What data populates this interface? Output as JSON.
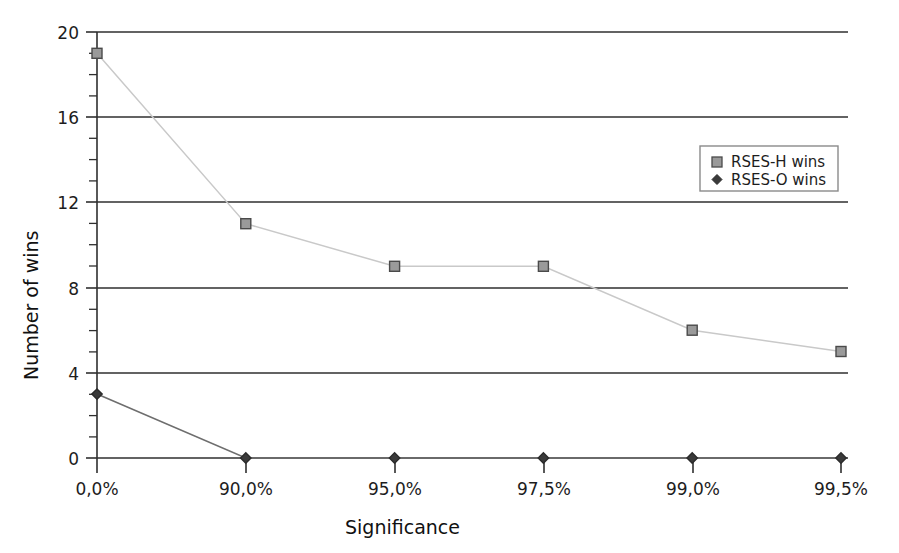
{
  "chart_data": {
    "type": "line",
    "title": "",
    "xlabel": "Significance",
    "ylabel": "Number of wins",
    "categories": [
      "0,0%",
      "90,0%",
      "95,0%",
      "97,5%",
      "99,0%",
      "99,5%"
    ],
    "series": [
      {
        "name": "RSES-H wins",
        "marker": "square",
        "color": "#c9c9c9",
        "marker_fill": "#9a9a9a",
        "marker_stroke": "#4a4a4a",
        "values": [
          19,
          11,
          9,
          9,
          6,
          5
        ]
      },
      {
        "name": "RSES-O wins",
        "marker": "diamond",
        "color": "#6e6e6e",
        "marker_fill": "#3a3a3a",
        "marker_stroke": "#2b2b2b",
        "values": [
          3,
          0,
          0,
          0,
          0,
          0
        ]
      }
    ],
    "ylim": [
      0,
      20
    ],
    "yticks": [
      0,
      4,
      8,
      12,
      16,
      20
    ],
    "ytick_labels": [
      "0",
      "4",
      "8",
      "12",
      "16",
      "20"
    ],
    "y_minor_step": 1,
    "grid": "horizontal-major",
    "legend_position": "upper-right-inside",
    "colors": {
      "grid": "#2f2f2f",
      "axis": "#2f2f2f",
      "background": "#ffffff",
      "legend_border": "#8a8a8a"
    }
  },
  "axes": {
    "y_label": "Number of wins",
    "x_label": "Significance",
    "y_tick_0": "0",
    "y_tick_1": "4",
    "y_tick_2": "8",
    "y_tick_3": "12",
    "y_tick_4": "16",
    "y_tick_5": "20",
    "x_tick_0": "0,0%",
    "x_tick_1": "90,0%",
    "x_tick_2": "95,0%",
    "x_tick_3": "97,5%",
    "x_tick_4": "99,0%",
    "x_tick_5": "99,5%"
  },
  "legend": {
    "entries": [
      {
        "label": "RSES-H wins",
        "marker": "square-marker"
      },
      {
        "label": "RSES-O wins",
        "marker": "diamond-marker"
      }
    ],
    "entry_0_label": "RSES-H wins",
    "entry_1_label": "RSES-O wins"
  }
}
